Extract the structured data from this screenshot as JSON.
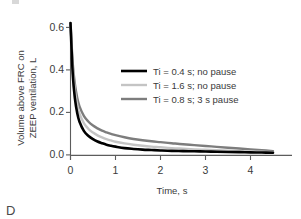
{
  "panel": {
    "label": "D"
  },
  "chart_data": {
    "type": "line",
    "title": "",
    "xlabel": "Time, s",
    "ylabel": "Volume above FRC on ZEEP ventilation, L",
    "ylabel_line1": "Volume above FRC on",
    "ylabel_line2": "ZEEP ventilation, L",
    "xlim": [
      0,
      4.55
    ],
    "ylim": [
      0,
      0.64
    ],
    "xticks": [
      0,
      1,
      2,
      3,
      4
    ],
    "xtick_labels": [
      "0",
      "1",
      "2",
      "3",
      "4"
    ],
    "yticks": [
      0.0,
      0.2,
      0.4,
      0.6
    ],
    "ytick_labels": [
      "0.0",
      "0.2",
      "0.4",
      "0.6"
    ],
    "grid": false,
    "legend_position": "center-right-upper",
    "x": [
      0,
      0.05,
      0.1,
      0.15,
      0.2,
      0.3,
      0.4,
      0.5,
      0.6,
      0.7,
      0.8,
      0.9,
      1.0,
      1.2,
      1.4,
      1.6,
      1.8,
      2.0,
      2.25,
      2.5,
      2.75,
      3.0,
      3.25,
      3.5,
      3.75,
      4.0,
      4.25,
      4.5
    ],
    "series": [
      {
        "name": "Ti = 0.4 s; no pause",
        "color": "#000000",
        "width": 2.6,
        "values": [
          0.62,
          0.38,
          0.262,
          0.196,
          0.156,
          0.112,
          0.089,
          0.074,
          0.063,
          0.055,
          0.048,
          0.043,
          0.039,
          0.032,
          0.028,
          0.025,
          0.023,
          0.021,
          0.019,
          0.018,
          0.017,
          0.016,
          0.015,
          0.014,
          0.013,
          0.012,
          0.011,
          0.01
        ]
      },
      {
        "name": "Ti = 1.6 s; no pause",
        "color": "#c4c4c4",
        "width": 2.4,
        "values": [
          0.62,
          0.41,
          0.3,
          0.235,
          0.194,
          0.148,
          0.122,
          0.105,
          0.092,
          0.082,
          0.074,
          0.068,
          0.062,
          0.054,
          0.048,
          0.043,
          0.039,
          0.036,
          0.032,
          0.029,
          0.026,
          0.024,
          0.022,
          0.02,
          0.018,
          0.016,
          0.015,
          0.013
        ]
      },
      {
        "name": "Ti = 0.8 s; 3 s pause",
        "color": "#7d7d7d",
        "width": 2.4,
        "values": [
          0.62,
          0.43,
          0.33,
          0.268,
          0.228,
          0.182,
          0.156,
          0.138,
          0.125,
          0.114,
          0.106,
          0.099,
          0.093,
          0.083,
          0.075,
          0.069,
          0.064,
          0.06,
          0.055,
          0.05,
          0.046,
          0.042,
          0.038,
          0.034,
          0.03,
          0.026,
          0.022,
          0.018
        ]
      }
    ]
  }
}
